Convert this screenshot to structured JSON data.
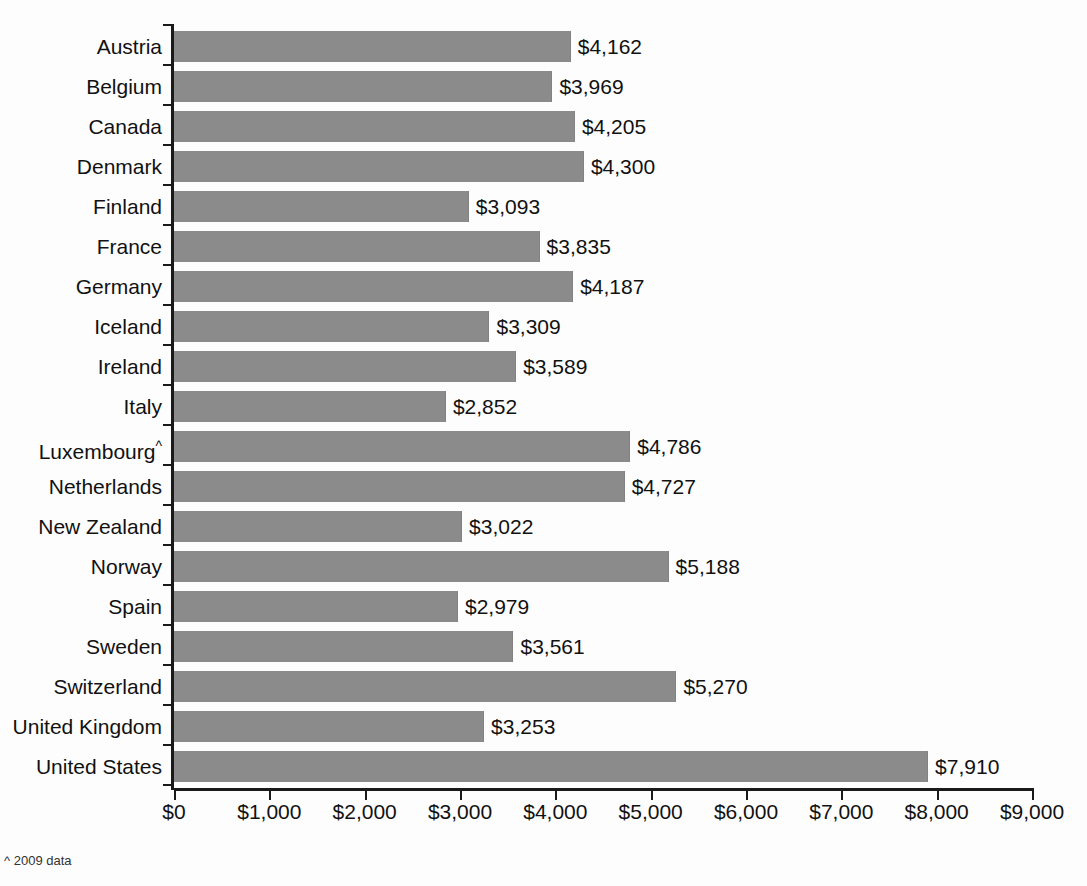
{
  "footnote": "^ 2009 data",
  "footnote_marker": "^",
  "chart_data": {
    "type": "bar",
    "orientation": "horizontal",
    "title": "",
    "xlabel": "",
    "ylabel": "",
    "xlim": [
      0,
      9000
    ],
    "grid": false,
    "legend": null,
    "bar_color": "#8b8b8b",
    "value_prefix": "$",
    "xticks": [
      0,
      1000,
      2000,
      3000,
      4000,
      5000,
      6000,
      7000,
      8000,
      9000
    ],
    "xtick_labels": [
      "$0",
      "$1,000",
      "$2,000",
      "$3,000",
      "$4,000",
      "$5,000",
      "$6,000",
      "$7,000",
      "$8,000",
      "$9,000"
    ],
    "categories": [
      "Austria",
      "Belgium",
      "Canada",
      "Denmark",
      "Finland",
      "France",
      "Germany",
      "Iceland",
      "Ireland",
      "Italy",
      "Luxembourg",
      "Netherlands",
      "New Zealand",
      "Norway",
      "Spain",
      "Sweden",
      "Switzerland",
      "United Kingdom",
      "United States"
    ],
    "category_markers": {
      "Luxembourg": "^"
    },
    "values": [
      4162,
      3969,
      4205,
      4300,
      3093,
      3835,
      4187,
      3309,
      3589,
      2852,
      4786,
      4727,
      3022,
      5188,
      2979,
      3561,
      5270,
      3253,
      7910
    ],
    "value_labels": [
      "$4,162",
      "$3,969",
      "$4,205",
      "$4,300",
      "$3,093",
      "$3,835",
      "$4,187",
      "$3,309",
      "$3,589",
      "$2,852",
      "$4,786",
      "$4,727",
      "$3,022",
      "$5,188",
      "$2,979",
      "$3,561",
      "$5,270",
      "$3,253",
      "$7,910"
    ]
  }
}
